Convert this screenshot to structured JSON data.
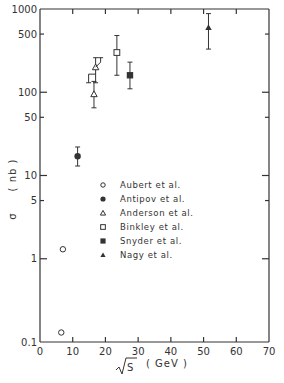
{
  "chart_data": {
    "type": "scatter",
    "title": "",
    "xlabel": "√S (GeV)",
    "ylabel": "σ (nb)",
    "xlim": [
      0,
      70
    ],
    "ylim": [
      0.1,
      1000
    ],
    "yscale": "log",
    "grid": false,
    "legend_position": "inside-center",
    "x_ticks": [
      "0",
      "10",
      "20",
      "30",
      "40",
      "50",
      "60",
      "70"
    ],
    "y_ticks": [
      "0.1",
      "1",
      "5",
      "10",
      "50",
      "100",
      "500",
      "1000"
    ],
    "series": [
      {
        "name": "Aubert et al.",
        "marker": "open-circle",
        "points": [
          {
            "x": 6.5,
            "y": 0.13
          },
          {
            "x": 7,
            "y": 1.3
          }
        ]
      },
      {
        "name": "Antipov et al.",
        "marker": "filled-circle",
        "points": [
          {
            "x": 11.5,
            "y": 17,
            "y_err_low": 13,
            "y_err_high": 22
          }
        ]
      },
      {
        "name": "Anderson et al.",
        "marker": "open-triangle",
        "points": [
          {
            "x": 16.5,
            "y": 95,
            "y_err_low": 65,
            "y_err_high": 135
          },
          {
            "x": 17,
            "y": 200,
            "y_err_low": 130,
            "y_err_high": 260
          }
        ]
      },
      {
        "name": "Binkley et al.",
        "marker": "open-square",
        "points": [
          {
            "x": 23.5,
            "y": 300,
            "y_err_low": 160,
            "y_err_high": 480
          }
        ]
      },
      {
        "name": "Snyder et al.",
        "marker": "filled-square",
        "points": [
          {
            "x": 27.5,
            "y": 160,
            "y_err_low": 110,
            "y_err_high": 230
          }
        ]
      },
      {
        "name": "Nagy et al.",
        "marker": "filled-triangle",
        "points": [
          {
            "x": 51.5,
            "y": 600,
            "y_err_low": 330,
            "y_err_high": 880
          }
        ]
      }
    ]
  },
  "axes": {
    "x_label_root": "S",
    "x_label_unit": "( GeV )",
    "y_label_sigma": "σ",
    "y_label_unit": "( nb )"
  },
  "legend": {
    "items": [
      {
        "label": "Aubert et al."
      },
      {
        "label": "Antipov et al."
      },
      {
        "label": "Anderson et al."
      },
      {
        "label": "Binkley et al."
      },
      {
        "label": "Snyder et al."
      },
      {
        "label": "Nagy et al."
      }
    ]
  },
  "colors": {
    "ink": "#333333",
    "background": "#ffffff"
  }
}
